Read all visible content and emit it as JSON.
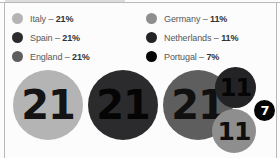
{
  "chart_data": {
    "type": "bubble",
    "title": "",
    "categories": [
      "Italy",
      "Spain",
      "England",
      "Germany",
      "Netherlands",
      "Portugal"
    ],
    "values": [
      21,
      11,
      21,
      11,
      21,
      7
    ],
    "unit": "%",
    "legend_position": "top",
    "grid": false,
    "series": [
      {
        "name": "Italy",
        "label": "Italy",
        "value": 21,
        "value_text": "21",
        "percent_text": "21%",
        "legend_text": "Italy – ",
        "color": "#b4b4b4"
      },
      {
        "name": "Spain",
        "label": "Spain",
        "value": 21,
        "value_text": "21",
        "percent_text": "21%",
        "legend_text": "Spain – ",
        "color": "#2b2b2d"
      },
      {
        "name": "England",
        "label": "England",
        "value": 21,
        "value_text": "21",
        "percent_text": "21%",
        "legend_text": "England – ",
        "color": "#5e5e5e"
      },
      {
        "name": "Germany",
        "label": "Germany",
        "value": 11,
        "value_text": "11",
        "percent_text": "11%",
        "legend_text": "Germany – ",
        "color": "#8e8e8e"
      },
      {
        "name": "Netherlands",
        "label": "Netherlands",
        "value": 11,
        "value_text": "11",
        "percent_text": "11%",
        "legend_text": "Netherlands – ",
        "color": "#232325"
      },
      {
        "name": "Portugal",
        "label": "Portugal",
        "value": 7,
        "value_text": "7",
        "percent_text": "7%",
        "legend_text": "Portugal – ",
        "color": "#050505"
      }
    ]
  },
  "legend": {
    "column_left": [
      {
        "label_text": "Italy – ",
        "percent": "21%",
        "color": "#b4b4b4"
      },
      {
        "label_text": "Spain – ",
        "percent": "21%",
        "color": "#2b2b2d"
      },
      {
        "label_text": "England – ",
        "percent": "21%",
        "color": "#5e5e5e"
      }
    ],
    "column_right": [
      {
        "label_text": "Germany – ",
        "percent": "11%",
        "color": "#8e8e8e"
      },
      {
        "label_text": "Netherlands – ",
        "percent": "11%",
        "color": "#232325"
      },
      {
        "label_text": "Portugal – ",
        "percent": "7%",
        "color": "#050505"
      }
    ]
  },
  "bubbles": [
    {
      "name": "italy",
      "value_text": "21",
      "color": "#b4b4b4",
      "text_color": "#141414",
      "x": 13,
      "y": 8,
      "size": 70,
      "font": 40
    },
    {
      "name": "spain",
      "value_text": "21",
      "color": "#2b2b2d",
      "text_color": "#050505",
      "x": 88,
      "y": 8,
      "size": 70,
      "font": 40
    },
    {
      "name": "england",
      "value_text": "21",
      "color": "#5e5e5e",
      "text_color": "#101010",
      "x": 163,
      "y": 8,
      "size": 70,
      "font": 40
    },
    {
      "name": "netherlands",
      "value_text": "11",
      "color": "#232325",
      "text_color": "#050505",
      "x": 215,
      "y": 5,
      "size": 41,
      "font": 24
    },
    {
      "name": "germany",
      "value_text": "11",
      "color": "#8e8e8e",
      "text_color": "#0e0e0e",
      "x": 212,
      "y": 47,
      "size": 44,
      "font": 25
    },
    {
      "name": "portugal",
      "value_text": "7",
      "color": "#050505",
      "text_color": "#ffffff",
      "x": 254,
      "y": 38,
      "size": 21,
      "font": 13
    }
  ]
}
